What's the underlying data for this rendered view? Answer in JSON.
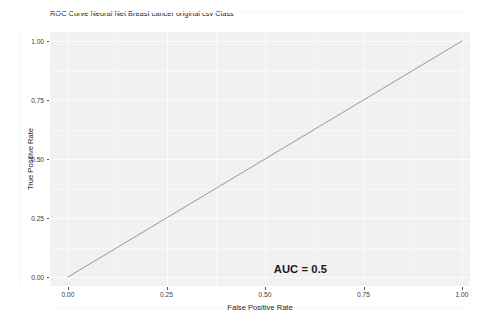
{
  "chart_data": {
    "type": "line",
    "title": "ROC Curve Neural Net Breast cancer original csv Class",
    "xlabel": "False Positive Rate",
    "ylabel": "True Positive Rate",
    "xlim": [
      0,
      1
    ],
    "ylim": [
      0,
      1
    ],
    "grid": true,
    "legend": "none",
    "x_ticks": [
      "0.00",
      "0.25",
      "0.50",
      "0.75",
      "1.00"
    ],
    "x_tick_values": [
      0,
      0.25,
      0.5,
      0.75,
      1
    ],
    "y_ticks": [
      "0.00",
      "0.25",
      "0.50",
      "0.75",
      "1.00"
    ],
    "y_tick_values": [
      0,
      0.25,
      0.5,
      0.75,
      1
    ],
    "series": [
      {
        "name": "ROC curve",
        "x": [
          0,
          1
        ],
        "values": [
          0,
          1
        ],
        "color": "#8c8c8c"
      }
    ],
    "annotations": [
      {
        "text": "AUC = 0.5",
        "x": 0.59,
        "y": 0.035,
        "bold": true
      }
    ],
    "auc": 0.5,
    "panel_background": "#f1f1f1",
    "gridline_color": "#fcfcfc",
    "line_color": "#8c8c8c",
    "text_color": "#231f20"
  }
}
